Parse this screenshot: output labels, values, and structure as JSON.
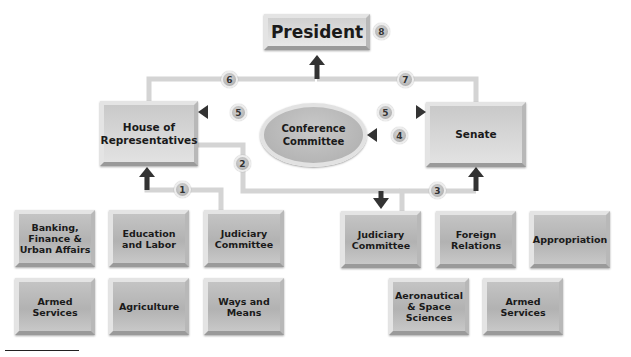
{
  "diagram": {
    "colors": {
      "background": "#ffffff",
      "box_fill": "#bdbdbd",
      "box_border": "#e4e4e4",
      "wire_light": "#d4d4d4",
      "wire_dark": "#3a3a3a",
      "text": "#1a1a1a"
    },
    "president": {
      "label": "President",
      "step": "8"
    },
    "house": {
      "label_line1": "House of",
      "label_line2": "Representatives"
    },
    "senate": {
      "label": "Senate"
    },
    "conference": {
      "label_line1": "Conference",
      "label_line2": "Committee"
    },
    "steps": {
      "s1": "1",
      "s2": "2",
      "s3": "3",
      "s4": "4",
      "s5a": "5",
      "s5b": "5",
      "s6": "6",
      "s7": "7"
    },
    "house_committees": [
      {
        "label_line1": "Banking,",
        "label_line2": "Finance &",
        "label_line3": "Urban Affairs"
      },
      {
        "label_line1": "Education",
        "label_line2": "and Labor"
      },
      {
        "label_line1": "Judiciary",
        "label_line2": "Committee"
      },
      {
        "label_line1": "Armed",
        "label_line2": "Services"
      },
      {
        "label_line1": "Agriculture"
      },
      {
        "label_line1": "Ways and",
        "label_line2": "Means"
      }
    ],
    "senate_committees": [
      {
        "label_line1": "Judiciary",
        "label_line2": "Committee"
      },
      {
        "label_line1": "Foreign",
        "label_line2": "Relations"
      },
      {
        "label_line1": "Appropriation"
      },
      {
        "label_line1": "Aeronautical",
        "label_line2": "& Space",
        "label_line3": "Sciences"
      },
      {
        "label_line1": "Armed",
        "label_line2": "Services"
      }
    ]
  }
}
